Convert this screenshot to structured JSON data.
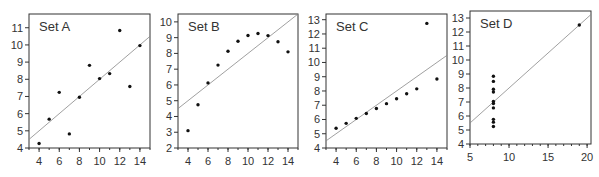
{
  "chart_data": [
    {
      "type": "scatter",
      "title": "Set A",
      "x": [
        10,
        8,
        13,
        9,
        11,
        14,
        6,
        4,
        12,
        7,
        5
      ],
      "y": [
        8.04,
        6.95,
        7.58,
        8.81,
        8.33,
        9.96,
        7.24,
        4.26,
        10.84,
        4.82,
        5.68
      ],
      "fit_line": {
        "slope": 0.5,
        "intercept": 3.0
      },
      "xlim": [
        3,
        15
      ],
      "ylim": [
        4,
        11.8
      ],
      "xticks": [
        4,
        6,
        8,
        10,
        12,
        14
      ],
      "yticks": [
        4,
        5,
        6,
        7,
        8,
        9,
        10,
        11
      ],
      "xlabel": "",
      "ylabel": "",
      "grid": false
    },
    {
      "type": "scatter",
      "title": "Set B",
      "x": [
        10,
        8,
        13,
        9,
        11,
        14,
        6,
        4,
        12,
        7,
        5
      ],
      "y": [
        9.14,
        8.14,
        8.74,
        8.77,
        9.26,
        8.1,
        6.13,
        3.1,
        9.13,
        7.26,
        4.74
      ],
      "fit_line": {
        "slope": 0.5,
        "intercept": 3.0
      },
      "xlim": [
        3,
        15
      ],
      "ylim": [
        2,
        10.5
      ],
      "xticks": [
        4,
        6,
        8,
        10,
        12,
        14
      ],
      "yticks": [
        2,
        3,
        4,
        5,
        6,
        7,
        8,
        9,
        10
      ],
      "xlabel": "",
      "ylabel": "",
      "grid": false
    },
    {
      "type": "scatter",
      "title": "Set C",
      "x": [
        10,
        8,
        13,
        9,
        11,
        14,
        6,
        4,
        12,
        7,
        5
      ],
      "y": [
        7.46,
        6.77,
        12.74,
        7.11,
        7.81,
        8.84,
        6.08,
        5.39,
        8.15,
        6.42,
        5.73
      ],
      "fit_line": {
        "slope": 0.5,
        "intercept": 3.0
      },
      "xlim": [
        3,
        15
      ],
      "ylim": [
        4,
        13.4
      ],
      "xticks": [
        4,
        6,
        8,
        10,
        12,
        14
      ],
      "yticks": [
        4,
        5,
        6,
        7,
        8,
        9,
        10,
        11,
        12,
        13
      ],
      "xlabel": "",
      "ylabel": "",
      "grid": false
    },
    {
      "type": "scatter",
      "title": "Set D",
      "x": [
        8,
        8,
        8,
        8,
        8,
        8,
        8,
        19,
        8,
        8,
        8
      ],
      "y": [
        6.58,
        5.76,
        7.71,
        8.84,
        8.47,
        7.04,
        5.25,
        12.5,
        5.56,
        7.91,
        6.89
      ],
      "fit_line": {
        "slope": 0.5,
        "intercept": 3.0
      },
      "xlim": [
        5,
        20.5
      ],
      "ylim": [
        4,
        13.5
      ],
      "xticks": [
        5,
        10,
        15,
        20
      ],
      "yticks": [
        4,
        5,
        6,
        7,
        8,
        9,
        10,
        11,
        12,
        13
      ],
      "xlabel": "",
      "ylabel": "",
      "grid": false
    }
  ],
  "panels": [
    {
      "label": "Set A"
    },
    {
      "label": "Set B"
    },
    {
      "label": "Set C"
    },
    {
      "label": "Set D"
    }
  ],
  "colors": {
    "frame": "#333333",
    "points": "#111111",
    "fit_line": "#888888",
    "text": "#333333"
  }
}
